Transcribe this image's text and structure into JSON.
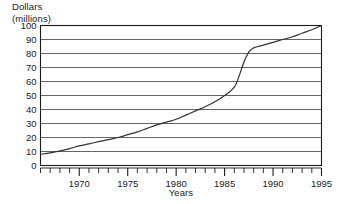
{
  "chart_data": {
    "type": "line",
    "title": "",
    "ylabel": "Dollars (millions)",
    "ylabel_line1": "Dollars",
    "ylabel_line2": "(millions)",
    "xlabel": "Years",
    "xlim": [
      1966,
      1995
    ],
    "ylim": [
      0,
      100
    ],
    "grid": true,
    "legend": false,
    "yticks": [
      0,
      10,
      20,
      30,
      40,
      50,
      60,
      70,
      80,
      90,
      100
    ],
    "ytick_labels": [
      "0",
      "10",
      "20",
      "30",
      "40",
      "50",
      "60",
      "70",
      "80",
      "90",
      "100"
    ],
    "xticks": [
      1966,
      1967,
      1968,
      1969,
      1970,
      1971,
      1972,
      1973,
      1974,
      1975,
      1976,
      1977,
      1978,
      1979,
      1980,
      1981,
      1982,
      1983,
      1984,
      1985,
      1986,
      1987,
      1988,
      1989,
      1990,
      1991,
      1992,
      1993,
      1994,
      1995
    ],
    "xtick_labels": [
      "1970",
      "1975",
      "1980",
      "1985",
      "1990",
      "1995"
    ],
    "xtick_label_values": [
      1970,
      1975,
      1980,
      1985,
      1990,
      1995
    ],
    "x": [
      1966,
      1967,
      1968,
      1969,
      1970,
      1971,
      1972,
      1973,
      1974,
      1975,
      1976,
      1977,
      1978,
      1979,
      1980,
      1981,
      1982,
      1983,
      1984,
      1985,
      1986,
      1986.5,
      1987,
      1987.5,
      1988,
      1989,
      1990,
      1991,
      1992,
      1993,
      1994,
      1995
    ],
    "values": [
      8,
      9,
      10.5,
      12,
      14,
      15.5,
      17,
      18.5,
      20,
      22,
      24,
      26.5,
      29,
      31,
      33,
      36,
      39,
      42,
      45.5,
      50,
      56,
      64,
      74,
      81,
      84,
      86,
      88,
      90,
      92,
      94.5,
      97,
      100
    ],
    "series": [
      {
        "name": "Dollars (millions)",
        "color": "#333333",
        "values": [
          8,
          9,
          10.5,
          12,
          14,
          15.5,
          17,
          18.5,
          20,
          22,
          24,
          26.5,
          29,
          31,
          33,
          36,
          39,
          42,
          45.5,
          50,
          56,
          64,
          74,
          81,
          84,
          86,
          88,
          90,
          92,
          94.5,
          97,
          100
        ]
      }
    ]
  },
  "colors": {
    "axis": "#1a1a1a",
    "grid": "#555555",
    "line": "#333333",
    "text": "#1a1a1a",
    "background": "#ffffff"
  }
}
